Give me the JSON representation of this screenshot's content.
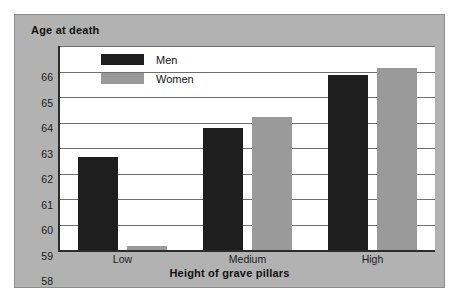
{
  "chart_data": {
    "type": "bar",
    "title": "Age at death",
    "xlabel": "Height of grave pillars",
    "ylabel": "Age at death",
    "categories": [
      "Low",
      "Medium",
      "High"
    ],
    "series": [
      {
        "name": "Men",
        "color": "#1e1e1e",
        "values": [
          61.65,
          62.8,
          64.85
        ]
      },
      {
        "name": "Women",
        "color": "#9a9a9a",
        "values": [
          58.15,
          63.2,
          65.15
        ]
      }
    ],
    "ylim": [
      58,
      66
    ],
    "yticks": [
      66,
      65,
      64,
      63,
      62,
      61,
      60,
      59,
      58
    ],
    "ytick_labels": [
      "66",
      "65",
      "64",
      "63",
      "62",
      "61",
      "60",
      "59",
      "58"
    ],
    "grid": "horizontal",
    "legend_position": "top-left-inside",
    "background_color": "#b2b2b2",
    "plot_background_color": "#ffffff",
    "gridline_color": "#6f6f6f",
    "axis_color": "#2b2b2b"
  },
  "legend": {
    "items": [
      {
        "label": "Men"
      },
      {
        "label": "Women"
      }
    ]
  }
}
